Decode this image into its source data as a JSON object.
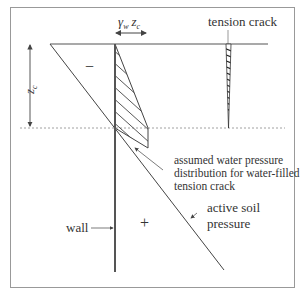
{
  "diagram": {
    "type": "retaining-wall-pressure-diagram",
    "labels": {
      "water_pressure_symbol_gamma": "γ",
      "water_pressure_symbol_sub_w": "w",
      "water_pressure_symbol_z": "z",
      "water_pressure_symbol_sub_c": "c",
      "tension_crack": "tension crack",
      "depth_symbol_z": "z",
      "depth_symbol_sub_c": "c",
      "minus_sign": "−",
      "plus_sign": "+",
      "water_note_line1": "assumed water pressure",
      "water_note_line2": "distribution for water-filled",
      "water_note_line3": "tension crack",
      "wall": "wall",
      "active_soil_line1": "active soil",
      "active_soil_line2": "pressure"
    },
    "colors": {
      "line": "#444444",
      "frame": "#999999",
      "text": "#333333"
    }
  }
}
